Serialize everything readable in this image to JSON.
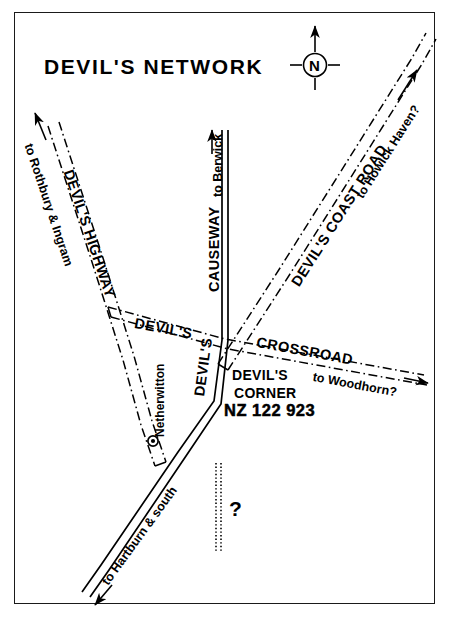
{
  "map": {
    "title": "DEVIL'S NETWORK",
    "compass": {
      "letter": "N",
      "name": "north-arrow"
    },
    "roads": [
      {
        "id": "devils-highway",
        "label": "DEVIL'S  HIGHWAY",
        "style": "dash-dot",
        "destination": "to Rothbury & Ingram",
        "destination_arrow": "↗"
      },
      {
        "id": "causeway",
        "label": "CAUSEWAY",
        "style": "double-solid",
        "destination": "to Berwick",
        "destination_arrow": "→"
      },
      {
        "id": "devils-coast-road",
        "label": "DEVIL'S  COAST  ROAD",
        "style": "dash-dot",
        "destination": "to Howick Haven?",
        "destination_arrow": "↗"
      },
      {
        "id": "devils-crossroad",
        "label_left": "DEVIL'S",
        "label_right": "CROSSROAD",
        "style": "dash-dot",
        "destination": "to Woodhorn?",
        "destination_arrow": "→"
      },
      {
        "id": "devils-south-road",
        "label": "DEVIL'S",
        "style": "double-solid",
        "destination": "to Hartburn & south",
        "destination_arrow": "←"
      },
      {
        "id": "unknown-route",
        "label": "?",
        "style": "double-dotted"
      }
    ],
    "places": [
      {
        "id": "netherwitton",
        "label": "Netherwitton",
        "marker": "bullseye-dot"
      }
    ],
    "junction": {
      "name": "DEVIL'S",
      "name2": "CORNER",
      "grid_reference": "NZ 122 923"
    },
    "colors": {
      "ink": "#000000",
      "paper": "#ffffff",
      "frame": "#1a1a1a"
    }
  }
}
